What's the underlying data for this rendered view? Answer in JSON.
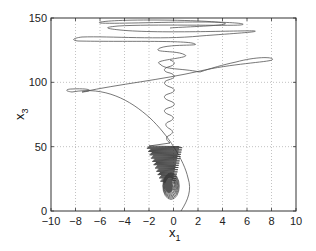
{
  "chart_data": {
    "type": "line",
    "title": "",
    "xlabel": "x",
    "xlabel_subscript": "1",
    "ylabel": "x",
    "ylabel_subscript": "3",
    "xlim": [
      -10,
      10
    ],
    "ylim": [
      0,
      150
    ],
    "xticks": [
      -10,
      -8,
      -6,
      -4,
      -2,
      0,
      2,
      4,
      6,
      8,
      10
    ],
    "yticks": [
      0,
      50,
      100,
      150
    ],
    "xtick_labels": [
      "−10",
      "−8",
      "−6",
      "−4",
      "−2",
      "0",
      "2",
      "4",
      "6",
      "8",
      "10"
    ],
    "ytick_labels": [
      "0",
      "50",
      "100",
      "150"
    ],
    "grid": true,
    "legend": null,
    "series": [
      {
        "name": "trajectory",
        "description": "Phase-plane trajectory x1 vs x3: starts near (2,0), arcs right to (~2.8,15) then up-left to (~-8,92) with a loop, crosses right to (~5,105) loop, then oscillates with large horizontal loops between x1≈-8 and x1≈5 for x3≈120–145, returning down through a narrow oscillating column near x1≈0 (x3 60–100) into a dense spiral/cone near x1∈[-3,2], x3∈[15,50] converging to ~ (0,20).",
        "points": [
          [
            2.0,
            0
          ],
          [
            2.6,
            8
          ],
          [
            2.8,
            15
          ],
          [
            2.5,
            25
          ],
          [
            1.8,
            35
          ],
          [
            0.8,
            45
          ],
          [
            -0.5,
            55
          ],
          [
            -2.5,
            67
          ],
          [
            -4.5,
            78
          ],
          [
            -6.5,
            88
          ],
          [
            -8.0,
            92
          ],
          [
            -7.2,
            93
          ],
          [
            -6.0,
            91.5
          ],
          [
            -2.5,
            97
          ],
          [
            1.0,
            103
          ],
          [
            4.5,
            106
          ],
          [
            7.5,
            105
          ],
          [
            5.0,
            104.5
          ],
          [
            3.0,
            106
          ],
          [
            1.0,
            113
          ],
          [
            -1.0,
            118
          ],
          [
            1.5,
            121
          ],
          [
            -0.5,
            124
          ],
          [
            4.0,
            127
          ],
          [
            -8.0,
            130
          ],
          [
            -2.0,
            129
          ],
          [
            3.5,
            133
          ],
          [
            -2.5,
            137
          ],
          [
            6.5,
            140
          ],
          [
            -6.0,
            141
          ],
          [
            4.5,
            143
          ],
          [
            -1.0,
            145
          ],
          [
            2.0,
            142
          ],
          [
            -3.0,
            139
          ],
          [
            1.5,
            135
          ],
          [
            0.0,
            120
          ]
        ]
      }
    ],
    "annotations": []
  }
}
